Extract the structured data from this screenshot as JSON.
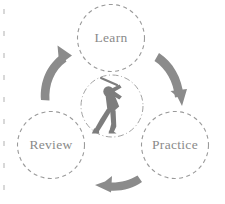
{
  "diagram": {
    "background_color": "#ffffff",
    "node_color": "#8a8a8a",
    "ring_color": "#9a9a9a",
    "arrow_color": "#8b8b8b",
    "figure_color": "#7d7d7d",
    "nodes": [
      {
        "id": "learn",
        "label": "Learn",
        "cx": 111,
        "cy": 38,
        "r": 33.5
      },
      {
        "id": "practice",
        "label": "Practice",
        "cx": 175,
        "cy": 145,
        "r": 33.5
      },
      {
        "id": "review",
        "label": "Review",
        "cx": 51,
        "cy": 145,
        "r": 33.5
      }
    ],
    "center": {
      "id": "golfer",
      "icon": "golfer-swing-icon",
      "cx": 112,
      "cy": 106,
      "r": 31
    },
    "arrows": [
      {
        "id": "learn-to-practice",
        "from": "learn",
        "to": "practice",
        "direction": "clockwise-right"
      },
      {
        "id": "practice-to-review",
        "from": "practice",
        "to": "review",
        "direction": "clockwise-bottom"
      },
      {
        "id": "review-to-learn",
        "from": "review",
        "to": "learn",
        "direction": "clockwise-left"
      }
    ]
  }
}
